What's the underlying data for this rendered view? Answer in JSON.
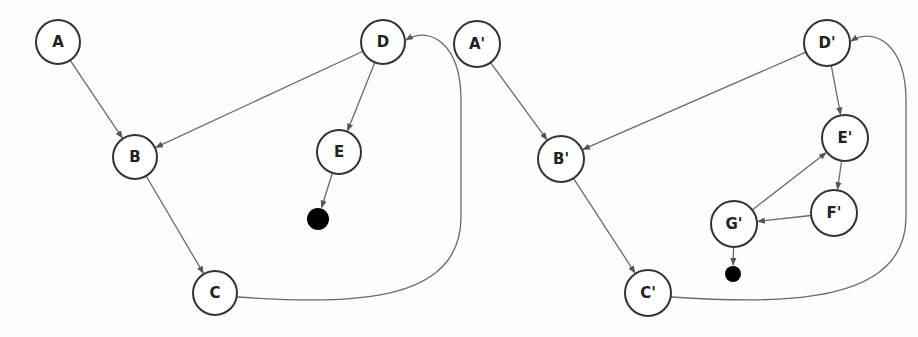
{
  "diagrams": [
    {
      "id": "original",
      "nodes": [
        {
          "id": "A",
          "label": "A",
          "x": 58,
          "y": 42,
          "r": 22
        },
        {
          "id": "B",
          "label": "B",
          "x": 135,
          "y": 157,
          "r": 22
        },
        {
          "id": "C",
          "label": "C",
          "x": 215,
          "y": 293,
          "r": 22
        },
        {
          "id": "D",
          "label": "D",
          "x": 383,
          "y": 42,
          "r": 22
        },
        {
          "id": "E",
          "label": "E",
          "x": 339,
          "y": 152,
          "r": 22
        }
      ],
      "sink": {
        "x": 318,
        "y": 219,
        "r": 11
      },
      "edges": [
        {
          "from": "A",
          "to": "B"
        },
        {
          "from": "D",
          "to": "B"
        },
        {
          "from": "B",
          "to": "C"
        },
        {
          "from": "D",
          "to": "E"
        },
        {
          "from": "E",
          "to": "sink"
        },
        {
          "from": "C",
          "to": "D",
          "curved": true
        }
      ]
    },
    {
      "id": "transformed",
      "nodes": [
        {
          "id": "A'",
          "label": "A'",
          "x": 477,
          "y": 44,
          "r": 23
        },
        {
          "id": "B'",
          "label": "B'",
          "x": 561,
          "y": 159,
          "r": 23
        },
        {
          "id": "C'",
          "label": "C'",
          "x": 648,
          "y": 293,
          "r": 23
        },
        {
          "id": "D'",
          "label": "D'",
          "x": 827,
          "y": 43,
          "r": 23
        },
        {
          "id": "E'",
          "label": "E'",
          "x": 845,
          "y": 138,
          "r": 23
        },
        {
          "id": "F'",
          "label": "F'",
          "x": 834,
          "y": 213,
          "r": 23
        },
        {
          "id": "G'",
          "label": "G'",
          "x": 734,
          "y": 224,
          "r": 23
        }
      ],
      "sink": {
        "x": 733,
        "y": 274,
        "r": 8
      },
      "edges": [
        {
          "from": "A'",
          "to": "B'"
        },
        {
          "from": "D'",
          "to": "B'"
        },
        {
          "from": "B'",
          "to": "C'"
        },
        {
          "from": "D'",
          "to": "E'"
        },
        {
          "from": "E'",
          "to": "F'"
        },
        {
          "from": "F'",
          "to": "G'"
        },
        {
          "from": "G'",
          "to": "E'"
        },
        {
          "from": "G'",
          "to": "sink"
        },
        {
          "from": "C'",
          "to": "D'",
          "curved": true
        }
      ]
    }
  ]
}
